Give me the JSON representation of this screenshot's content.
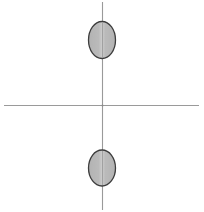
{
  "figure": {
    "title": "",
    "width": 204,
    "height": 212,
    "background_color": "#ffffff"
  },
  "axes": {
    "origin": {
      "x": 102,
      "y": 105
    },
    "horizontal": {
      "name": "horizontal-axis",
      "x1": 4,
      "y1": 105,
      "x2": 199,
      "y2": 105,
      "color": "#9a9a9a",
      "stroke_width": 1.1
    },
    "vertical": {
      "name": "vertical-axis",
      "x1": 102,
      "y1": 2,
      "x2": 102,
      "y2": 210,
      "color": "#9a9a9a",
      "stroke_width": 1.1
    }
  },
  "chart_data": {
    "type": "scatter",
    "title": "",
    "xlabel": "",
    "ylabel": "",
    "xlim": [
      -102,
      102
    ],
    "ylim": [
      -105,
      107
    ],
    "grid": false,
    "legend": null,
    "tick_labels": {
      "x": [],
      "y": []
    },
    "annotations": [],
    "series": [
      {
        "name": "upper-lobe",
        "marker": "ellipse",
        "x": [
          0
        ],
        "y": [
          65
        ],
        "width": 27,
        "height": 37,
        "fill": "#b0b0b0",
        "pattern": "checker-hatch",
        "outline": "#3a3a3a"
      },
      {
        "name": "lower-lobe",
        "marker": "ellipse",
        "x": [
          0
        ],
        "y": [
          -63
        ],
        "width": 27,
        "height": 36,
        "fill": "#b0b0b0",
        "pattern": "checker-hatch",
        "outline": "#3a3a3a"
      }
    ]
  },
  "shapes": {
    "upper_ellipse": {
      "label": "upper-ellipse",
      "cx": 102,
      "cy": 40,
      "rx": 13.5,
      "ry": 18.5,
      "fill_color": "#b2b2b2",
      "stroke_color": "#3d3d3d",
      "stroke_width": 1.3,
      "pattern": "checker-hatch"
    },
    "lower_ellipse": {
      "label": "lower-ellipse",
      "cx": 102,
      "cy": 168,
      "rx": 13.5,
      "ry": 18,
      "fill_color": "#b2b2b2",
      "stroke_color": "#3d3d3d",
      "stroke_width": 1.3,
      "pattern": "checker-hatch"
    }
  },
  "colors": {
    "axis": "#9a9a9a",
    "ellipse_fill": "#b2b2b2",
    "ellipse_stroke": "#3d3d3d",
    "pattern_dark": "#8e8e8e",
    "pattern_light": "#d6d6d6",
    "background": "#ffffff"
  }
}
